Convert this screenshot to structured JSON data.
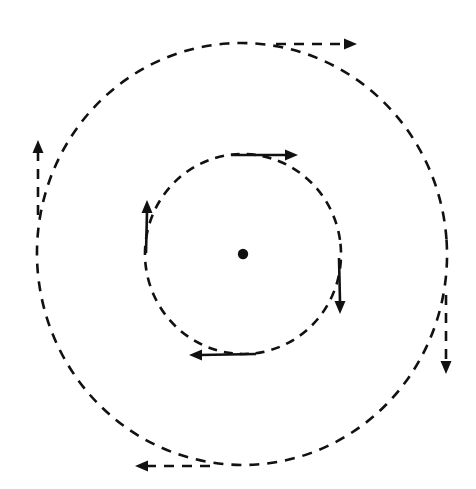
{
  "figure": {
    "background_color": "#ffffff",
    "stroke_color": "#111111",
    "width": 476,
    "height": 489
  },
  "chart_data": {
    "type": "scatter",
    "subtitle": "",
    "xlabel": "",
    "ylabel": "",
    "xlim": [
      0,
      476
    ],
    "ylim": [
      0,
      489
    ],
    "grid": false,
    "legend_position": "none",
    "tick_labels": {
      "x": [],
      "y": []
    },
    "annotations": [],
    "center": {
      "label": "center-point",
      "x": 243,
      "y": 254,
      "radius": 5.2,
      "color": "#111111"
    },
    "circles": [
      {
        "name": "inner-orbit",
        "cx": 243,
        "cy": 254,
        "rx": 98,
        "ry": 100,
        "rotation_deg": -6,
        "style": "dashed",
        "dash": "9 7",
        "stroke_width": 2.6,
        "color": "#111111",
        "direction": "clockwise"
      },
      {
        "name": "outer-orbit",
        "cx": 242,
        "cy": 254,
        "rx": 205,
        "ry": 211,
        "rotation_deg": -4,
        "style": "dashed",
        "dash": "10 8",
        "stroke_width": 2.6,
        "color": "#111111",
        "direction": "clockwise"
      }
    ],
    "arrows": [
      {
        "name": "inner-top-arrow",
        "orbit": "inner-orbit",
        "position": "top",
        "direction": "right",
        "angle_deg": 0,
        "shaft_from": {
          "x": 231,
          "y": 155
        },
        "shaft_to": {
          "x": 290,
          "y": 155
        },
        "tip": {
          "x": 298,
          "y": 155
        },
        "style": "solid",
        "head_length": 13,
        "head_width": 11,
        "stroke_width": 2.6,
        "color": "#111111"
      },
      {
        "name": "inner-right-arrow",
        "orbit": "inner-orbit",
        "position": "right",
        "direction": "down",
        "angle_deg": 90,
        "shaft_from": {
          "x": 339,
          "y": 258
        },
        "shaft_to": {
          "x": 340,
          "y": 302
        },
        "tip": {
          "x": 340,
          "y": 314
        },
        "style": "solid",
        "head_length": 13,
        "head_width": 11,
        "stroke_width": 2.6,
        "color": "#111111"
      },
      {
        "name": "inner-bottom-arrow",
        "orbit": "inner-orbit",
        "position": "bottom",
        "direction": "left",
        "angle_deg": 180,
        "shaft_from": {
          "x": 256,
          "y": 354
        },
        "shaft_to": {
          "x": 200,
          "y": 355
        },
        "tip": {
          "x": 189,
          "y": 355
        },
        "style": "solid",
        "head_length": 13,
        "head_width": 11,
        "stroke_width": 2.6,
        "color": "#111111"
      },
      {
        "name": "inner-left-arrow",
        "orbit": "inner-orbit",
        "position": "left",
        "direction": "up",
        "angle_deg": 270,
        "shaft_from": {
          "x": 146,
          "y": 253
        },
        "shaft_to": {
          "x": 147,
          "y": 212
        },
        "tip": {
          "x": 147,
          "y": 200
        },
        "style": "solid",
        "head_length": 13,
        "head_width": 11,
        "stroke_width": 2.6,
        "color": "#111111"
      },
      {
        "name": "outer-top-arrow",
        "orbit": "outer-orbit",
        "position": "top",
        "direction": "right",
        "angle_deg": 0,
        "shaft_from": {
          "x": 276,
          "y": 44
        },
        "shaft_to": {
          "x": 345,
          "y": 44
        },
        "tip": {
          "x": 357,
          "y": 44
        },
        "style": "dashed",
        "dash": "10 8",
        "head_length": 13,
        "head_width": 11,
        "stroke_width": 2.6,
        "color": "#111111"
      },
      {
        "name": "outer-right-arrow",
        "orbit": "outer-orbit",
        "position": "right",
        "direction": "down",
        "angle_deg": 90,
        "shaft_from": {
          "x": 446,
          "y": 295
        },
        "shaft_to": {
          "x": 446,
          "y": 362
        },
        "tip": {
          "x": 446,
          "y": 374
        },
        "style": "dashed",
        "dash": "10 8",
        "head_length": 13,
        "head_width": 11,
        "stroke_width": 2.6,
        "color": "#111111"
      },
      {
        "name": "outer-bottom-arrow",
        "orbit": "outer-orbit",
        "position": "bottom",
        "direction": "left",
        "angle_deg": 180,
        "shaft_from": {
          "x": 210,
          "y": 466
        },
        "shaft_to": {
          "x": 147,
          "y": 466
        },
        "tip": {
          "x": 135,
          "y": 466
        },
        "style": "dashed",
        "dash": "10 8",
        "head_length": 13,
        "head_width": 11,
        "stroke_width": 2.6,
        "color": "#111111"
      },
      {
        "name": "outer-left-arrow",
        "orbit": "outer-orbit",
        "position": "left",
        "direction": "up",
        "angle_deg": 270,
        "shaft_from": {
          "x": 38,
          "y": 215
        },
        "shaft_to": {
          "x": 38,
          "y": 152
        },
        "tip": {
          "x": 38,
          "y": 140
        },
        "style": "dashed",
        "dash": "10 8",
        "head_length": 13,
        "head_width": 11,
        "stroke_width": 2.6,
        "color": "#111111"
      }
    ]
  }
}
